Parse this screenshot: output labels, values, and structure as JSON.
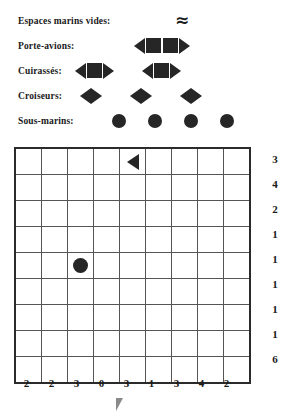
{
  "legend": {
    "rows": [
      {
        "label": "Espaces marins vides:",
        "symbol": "wave-icon",
        "count": 1,
        "glyph": "≈",
        "symbols_left": 175
      },
      {
        "label": "Porte-avions:",
        "symbol": "carrier-icon",
        "count": 1,
        "parts": [
          "tri-left",
          "square",
          "square",
          "tri-right"
        ],
        "symbols_left": 134
      },
      {
        "label": "Cuirassés:",
        "symbol": "battleship-icon",
        "count": 2,
        "parts": [
          "tri-left",
          "square",
          "tri-right"
        ],
        "symbols_left": 75
      },
      {
        "label": "Croiseurs:",
        "symbol": "cruiser-icon",
        "count": 3,
        "parts": [
          "tri-left",
          "tri-right"
        ],
        "symbols_left": 80
      },
      {
        "label": "Sous-marins:",
        "symbol": "submarine-icon",
        "count": 4,
        "parts": [
          "circle"
        ],
        "symbols_left": 112
      }
    ]
  },
  "board": {
    "rows": 9,
    "cols": 9,
    "row_clues": [
      3,
      4,
      2,
      1,
      1,
      1,
      1,
      1,
      6
    ],
    "col_clues": [
      2,
      2,
      3,
      0,
      3,
      1,
      3,
      4,
      2
    ],
    "cells": [
      [
        "",
        "",
        "",
        "",
        "tri-left",
        "",
        "",
        "",
        ""
      ],
      [
        "",
        "",
        "",
        "",
        "",
        "",
        "",
        "",
        ""
      ],
      [
        "",
        "",
        "",
        "",
        "",
        "",
        "",
        "",
        ""
      ],
      [
        "",
        "",
        "",
        "",
        "",
        "",
        "",
        "",
        ""
      ],
      [
        "",
        "",
        "circle",
        "",
        "",
        "",
        "",
        "",
        ""
      ],
      [
        "",
        "",
        "",
        "",
        "",
        "",
        "",
        "",
        ""
      ],
      [
        "",
        "",
        "",
        "",
        "",
        "",
        "",
        "",
        ""
      ],
      [
        "",
        "",
        "",
        "",
        "",
        "",
        "",
        "",
        ""
      ],
      [
        "",
        "",
        "",
        "",
        "",
        "",
        "",
        "",
        ""
      ]
    ]
  },
  "colors": {
    "ink": "#262626",
    "grid_line": "#555555",
    "grid_border": "#2b2b2b",
    "pointer": "#8a8a8a"
  }
}
